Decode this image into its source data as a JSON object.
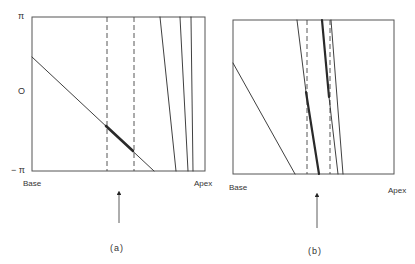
{
  "figure": {
    "panels": [
      {
        "id": "a",
        "caption": "(a)",
        "y_labels": {
          "top": "π",
          "middle": "O",
          "bottom": "− π"
        },
        "x_labels": {
          "left": "Base",
          "right": "Apex"
        },
        "frame": {
          "x1": 32,
          "y1": 17,
          "x2": 205,
          "y2": 171
        },
        "dashed_lines_x": [
          107,
          134
        ],
        "lines": [
          {
            "x1": 32,
            "y1": 57,
            "x2": 154,
            "y2": 171,
            "width": 0.9
          },
          {
            "x1": 106,
            "y1": 126,
            "x2": 133,
            "y2": 151,
            "width": 2.6
          },
          {
            "x1": 160,
            "y1": 17,
            "x2": 176,
            "y2": 171,
            "width": 0.9
          },
          {
            "x1": 180,
            "y1": 17,
            "x2": 188,
            "y2": 171,
            "width": 0.9
          },
          {
            "x1": 191,
            "y1": 17,
            "x2": 193,
            "y2": 171,
            "width": 0.9
          }
        ],
        "arrow": {
          "x": 119,
          "y_tip": 190,
          "y_tail": 223
        }
      },
      {
        "id": "b",
        "caption": "(b)",
        "x_labels": {
          "left": "Base",
          "right": "Apex"
        },
        "frame": {
          "x1": 233,
          "y1": 20,
          "x2": 394,
          "y2": 174
        },
        "dashed_lines_x": [
          307,
          330
        ],
        "lines": [
          {
            "x1": 233,
            "y1": 63,
            "x2": 295,
            "y2": 174,
            "width": 0.9
          },
          {
            "x1": 297,
            "y1": 20,
            "x2": 306,
            "y2": 92,
            "width": 0.9
          },
          {
            "x1": 306,
            "y1": 92,
            "x2": 319,
            "y2": 174,
            "width": 2.2
          },
          {
            "x1": 322,
            "y1": 20,
            "x2": 329,
            "y2": 97,
            "width": 2.2
          },
          {
            "x1": 329,
            "y1": 97,
            "x2": 338,
            "y2": 174,
            "width": 0.9
          },
          {
            "x1": 331,
            "y1": 20,
            "x2": 343,
            "y2": 174,
            "width": 0.9
          }
        ],
        "arrow": {
          "x": 317,
          "y_tip": 192,
          "y_tail": 228
        }
      }
    ],
    "colors": {
      "line": "#2a2a2a",
      "frame": "#555555",
      "dashed": "#444444"
    }
  }
}
